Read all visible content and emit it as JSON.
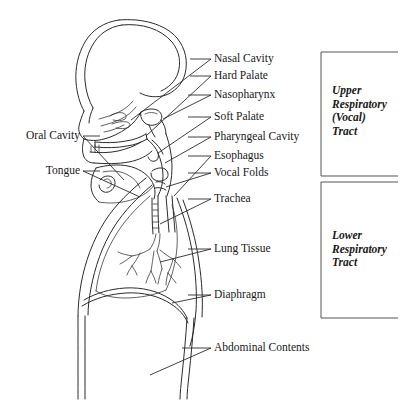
{
  "figure": {
    "kind": "anatomical-diagram",
    "background_color": "#ffffff",
    "line_color": "#2b2b2b",
    "bracket_color": "#555555"
  },
  "labels_right": [
    {
      "key": "nasal-cavity",
      "text": "Nasal Cavity"
    },
    {
      "key": "hard-palate",
      "text": "Hard Palate"
    },
    {
      "key": "nasopharynx",
      "text": "Nasopharynx"
    },
    {
      "key": "soft-palate",
      "text": "Soft Palate"
    },
    {
      "key": "pharyngeal-cavity",
      "text": "Pharyngeal Cavity"
    },
    {
      "key": "esophagus",
      "text": "Esophagus"
    },
    {
      "key": "vocal-folds",
      "text": "Vocal Folds"
    },
    {
      "key": "trachea",
      "text": "Trachea"
    },
    {
      "key": "lung-tissue",
      "text": "Lung Tissue"
    },
    {
      "key": "diaphragm",
      "text": "Diaphragm"
    },
    {
      "key": "abdominal-contents",
      "text": "Abdominal Contents"
    }
  ],
  "labels_left": [
    {
      "key": "oral-cavity",
      "text": "Oral Cavity"
    },
    {
      "key": "tongue",
      "text": "Tongue"
    }
  ],
  "groups": [
    {
      "key": "upper-respiratory-tract",
      "lines": [
        "Upper",
        "Respiratory",
        "(Vocal)",
        "Tract"
      ],
      "text": "Upper Respiratory (Vocal) Tract"
    },
    {
      "key": "lower-respiratory-tract",
      "lines": [
        "Lower",
        "Respiratory",
        "Tract"
      ],
      "text": "Lower Respiratory Tract"
    }
  ],
  "text": {
    "nasal_cavity": "Nasal Cavity",
    "hard_palate": "Hard Palate",
    "nasopharynx": "Nasopharynx",
    "soft_palate": "Soft Palate",
    "pharyngeal_cavity": "Pharyngeal Cavity",
    "esophagus": "Esophagus",
    "vocal_folds": "Vocal Folds",
    "trachea": "Trachea",
    "lung_tissue": "Lung Tissue",
    "diaphragm": "Diaphragm",
    "abdominal_contents": "Abdominal Contents",
    "oral_cavity": "Oral Cavity",
    "tongue": "Tongue",
    "upper_1": "Upper",
    "upper_2": "Respiratory",
    "upper_3": "(Vocal)",
    "upper_4": "Tract",
    "lower_1": "Lower",
    "lower_2": "Respiratory",
    "lower_3": "Tract"
  }
}
